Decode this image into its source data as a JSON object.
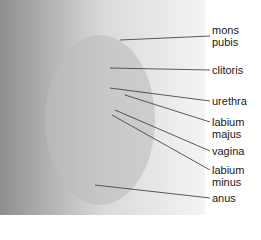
{
  "diagram": {
    "type": "anatomical-illustration",
    "labels": [
      {
        "id": "mons-pubis",
        "text_line1": "mons",
        "text_line2": "pubis",
        "y": 30
      },
      {
        "id": "clitoris",
        "text_line1": "clitoris",
        "text_line2": "",
        "y": 64
      },
      {
        "id": "urethra",
        "text_line1": "urethra",
        "text_line2": "",
        "y": 95
      },
      {
        "id": "labium-majus",
        "text_line1": "labium",
        "text_line2": "majus",
        "y": 116
      },
      {
        "id": "vagina",
        "text_line1": "vagina",
        "text_line2": "",
        "y": 145
      },
      {
        "id": "labium-minus",
        "text_line1": "labium",
        "text_line2": "minus",
        "y": 164
      },
      {
        "id": "anus",
        "text_line1": "anus",
        "text_line2": "",
        "y": 192
      }
    ],
    "colors": {
      "background": "#ffffff",
      "leader_line": "#333333",
      "text": "#1a1a1a",
      "figure_base": "#cfcfcf",
      "figure_shadow": "#9a9a9a"
    }
  }
}
